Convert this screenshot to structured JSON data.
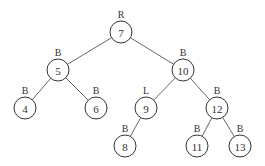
{
  "tree": {
    "radius": 11,
    "nodes": [
      {
        "id": "7",
        "label": "7",
        "tag": "R",
        "x": 121,
        "y": 32
      },
      {
        "id": "5",
        "label": "5",
        "tag": "B",
        "x": 58,
        "y": 70
      },
      {
        "id": "10",
        "label": "10",
        "tag": "B",
        "x": 183,
        "y": 70
      },
      {
        "id": "4",
        "label": "4",
        "tag": "B",
        "x": 25,
        "y": 108
      },
      {
        "id": "6",
        "label": "6",
        "tag": "B",
        "x": 96,
        "y": 108
      },
      {
        "id": "9",
        "label": "9",
        "tag": "L",
        "x": 146,
        "y": 108
      },
      {
        "id": "12",
        "label": "12",
        "tag": "B",
        "x": 217,
        "y": 108
      },
      {
        "id": "8",
        "label": "8",
        "tag": "B",
        "x": 125,
        "y": 146
      },
      {
        "id": "11",
        "label": "11",
        "tag": "B",
        "x": 197,
        "y": 146
      },
      {
        "id": "13",
        "label": "13",
        "tag": "B",
        "x": 240,
        "y": 146
      }
    ],
    "edges": [
      [
        "7",
        "5"
      ],
      [
        "7",
        "10"
      ],
      [
        "5",
        "4"
      ],
      [
        "5",
        "6"
      ],
      [
        "10",
        "9"
      ],
      [
        "10",
        "12"
      ],
      [
        "9",
        "8"
      ],
      [
        "12",
        "11"
      ],
      [
        "12",
        "13"
      ]
    ]
  }
}
